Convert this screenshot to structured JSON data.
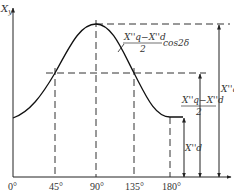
{
  "diagram": {
    "type": "line-plot-with-annotations",
    "y_axis_label": "X",
    "y_axis_label_sub": "y",
    "x_ticks": [
      "0°",
      "45°",
      "90°",
      "135°",
      "180°"
    ],
    "curve_description": "X_y varies sinusoidally with δ: minimum X''d at 0° and 180°, maximum X''q at 90°",
    "annotations": {
      "amplitude_term_num": "X''q−X''d",
      "amplitude_term_den": "2",
      "amplitude_term_suffix": "cos2δ",
      "max_label": "X''q",
      "mid_term_num": "X''q−X''d",
      "mid_term_den": "2",
      "min_label": "X''d"
    }
  },
  "colors": {
    "line": "#222222",
    "background": "#ffffff"
  }
}
